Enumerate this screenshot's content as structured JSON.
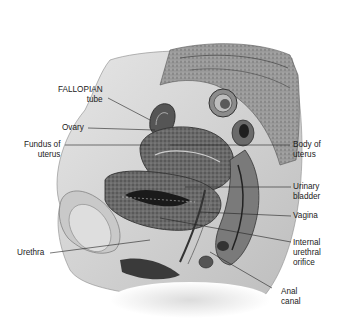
{
  "diagram": {
    "type": "anatomical sagittal section",
    "labels": [
      {
        "id": "fallopian-tube",
        "lines": [
          "FALLOPIAN",
          "tube"
        ],
        "side": "left"
      },
      {
        "id": "ovary",
        "lines": [
          "Ovary"
        ],
        "side": "left"
      },
      {
        "id": "fundus-of-uterus",
        "lines": [
          "Fundus of",
          "uterus"
        ],
        "side": "left"
      },
      {
        "id": "urethra",
        "lines": [
          "Urethra"
        ],
        "side": "left"
      },
      {
        "id": "body-of-uterus",
        "lines": [
          "Body of",
          "uterus"
        ],
        "side": "right"
      },
      {
        "id": "urinary-bladder",
        "lines": [
          "Urinary",
          "bladder"
        ],
        "side": "right"
      },
      {
        "id": "vagina",
        "lines": [
          "Vagina"
        ],
        "side": "right"
      },
      {
        "id": "internal-urethral-orifice",
        "lines": [
          "Internal",
          "urethral",
          "orifice"
        ],
        "side": "right"
      },
      {
        "id": "anal-canal",
        "lines": [
          "Anal",
          "canal"
        ],
        "side": "right"
      }
    ]
  }
}
